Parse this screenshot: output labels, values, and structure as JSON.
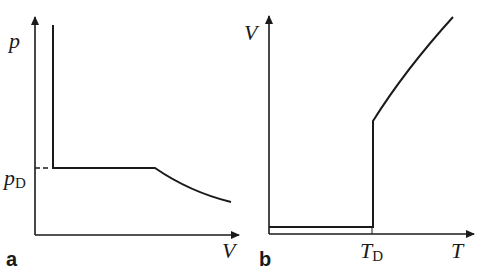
{
  "panels": [
    {
      "id": "a",
      "label": "a",
      "y_axis_label": "p",
      "x_axis_label": "V",
      "level_label_main": "p",
      "level_label_sub": "D"
    },
    {
      "id": "b",
      "label": "b",
      "y_axis_label": "V",
      "x_axis_label": "T",
      "level_label_main": "T",
      "level_label_sub": "D"
    }
  ],
  "colors": {
    "line": "#1a1a1a",
    "background": "#ffffff"
  }
}
